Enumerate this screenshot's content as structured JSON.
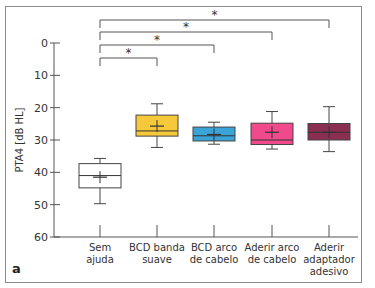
{
  "panel_label": "a",
  "chart_data": {
    "type": "box",
    "title": "",
    "xlabel": "",
    "ylabel": "PTA4 [dB HL]",
    "ylim": [
      0,
      60
    ],
    "y_inverted": true,
    "yticks": [
      0,
      10,
      20,
      30,
      40,
      50,
      60
    ],
    "grid": false,
    "categories": [
      [
        "Sem",
        "ajuda"
      ],
      [
        "BCD banda",
        "suave"
      ],
      [
        "BCD arco",
        "de cabelo"
      ],
      [
        "Aderir arco",
        "de cabelo"
      ],
      [
        "Aderir",
        "adaptador",
        "adesivo"
      ]
    ],
    "series": [
      {
        "name": "Sem ajuda",
        "whisker_low": 35.7,
        "q1": 37.3,
        "median": 41.0,
        "q3": 44.8,
        "whisker_high": 49.7,
        "mean": 41.5,
        "color": "#ffffff"
      },
      {
        "name": "BCD banda suave",
        "whisker_low": 18.8,
        "q1": 22.3,
        "median": 27.2,
        "q3": 28.8,
        "whisker_high": 32.3,
        "mean": 25.7,
        "color": "#f5c93a"
      },
      {
        "name": "BCD arco de cabelo",
        "whisker_low": 24.5,
        "q1": 26.0,
        "median": 28.7,
        "q3": 30.3,
        "whisker_high": 31.3,
        "mean": 28.3,
        "color": "#3aa3d8"
      },
      {
        "name": "Aderir arco de cabelo",
        "whisker_low": 21.2,
        "q1": 24.8,
        "median": 30.0,
        "q3": 31.4,
        "whisker_high": 32.8,
        "mean": 27.6,
        "color": "#f04a8c"
      },
      {
        "name": "Aderir adaptador adesivo",
        "whisker_low": 19.7,
        "q1": 24.9,
        "median": 27.6,
        "q3": 30.0,
        "whisker_high": 33.6,
        "mean": 27.6,
        "color": "#8a2e52"
      }
    ],
    "significance": [
      {
        "from": 0,
        "to": 1,
        "label": "*"
      },
      {
        "from": 0,
        "to": 2,
        "label": "*"
      },
      {
        "from": 0,
        "to": 3,
        "label": "*"
      },
      {
        "from": 0,
        "to": 4,
        "label": "*"
      }
    ]
  }
}
